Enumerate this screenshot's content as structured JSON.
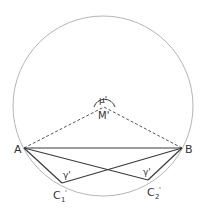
{
  "diagram": {
    "colors": {
      "circle": "#b5b5b5",
      "lines": "#3a3a3a",
      "dashed": "#555555",
      "text": "#333333"
    },
    "labels": {
      "A": "A",
      "B": "B",
      "M": "M'",
      "mu": "μ'",
      "C1": "C",
      "C1_sub": "1",
      "C1_prime": "'",
      "C2": "C",
      "C2_sub": "2",
      "C2_prime": "'",
      "gamma1": "γ'",
      "gamma2": "γ'"
    },
    "points": {
      "A": [
        24,
        148
      ],
      "B": [
        182,
        148
      ],
      "M": [
        104,
        107
      ],
      "C1": [
        62,
        183
      ],
      "C2": [
        148,
        180
      ]
    },
    "circle": {
      "cx": 103,
      "cy": 106,
      "r": 90
    }
  }
}
